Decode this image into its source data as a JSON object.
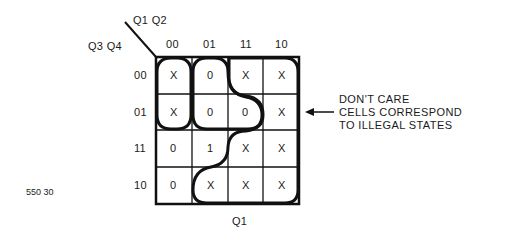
{
  "kmap": {
    "row_var_label": "Q3 Q4",
    "col_var_label": "Q1 Q2",
    "col_headers": [
      "00",
      "01",
      "11",
      "10"
    ],
    "row_headers": [
      "00",
      "01",
      "11",
      "10"
    ],
    "cells": [
      [
        "X",
        "0",
        "X",
        "X"
      ],
      [
        "X",
        "0",
        "0",
        "X"
      ],
      [
        "0",
        "1",
        "X",
        "X"
      ],
      [
        "0",
        "X",
        "X",
        "X"
      ]
    ],
    "bottom_label": "Q1",
    "groupings": [
      "Q1 group: columns 11 and 10 plus X cells (rows 00-01 col 11/10, rows 11-10 cols 11/10, row 10 col 01)",
      "Q3' Q4'-style group: column 00 rows 00-01 (X, X)",
      "Column 01 rows 00-01 group (0, 0) with col 11 row 01"
    ]
  },
  "annotation": {
    "lines": [
      "DON'T CARE",
      "CELLS CORRESPOND",
      "TO ILLEGAL STATES"
    ],
    "arrow": "left-arrow"
  },
  "figure_id": "550 30"
}
